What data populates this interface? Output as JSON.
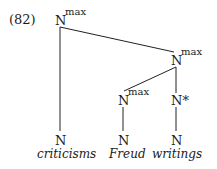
{
  "example_number": "(82)",
  "tree": {
    "root": {
      "label": "N",
      "sup": "max"
    },
    "right_phrase": {
      "label": "N",
      "sup": "max"
    },
    "freud_phrase": {
      "label": "N",
      "sup": "max"
    },
    "n_star": {
      "label": "N*"
    },
    "leaves": [
      {
        "label": "N",
        "word": "criticisms"
      },
      {
        "label": "N",
        "word": "Freud"
      },
      {
        "label": "N",
        "word": "writings"
      }
    ]
  }
}
